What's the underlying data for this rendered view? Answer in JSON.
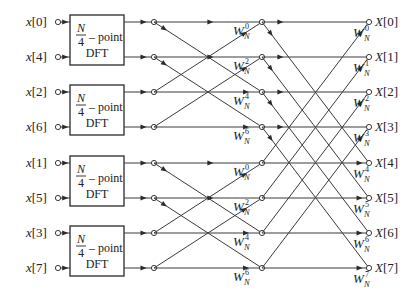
{
  "diagram": {
    "inputs": [
      "x[0]",
      "x[4]",
      "x[2]",
      "x[6]",
      "x[1]",
      "x[5]",
      "x[3]",
      "x[7]"
    ],
    "outputs": [
      "X[0]",
      "X[1]",
      "X[2]",
      "X[3]",
      "X[4]",
      "X[5]",
      "X[6]",
      "X[7]"
    ],
    "dft_blocks": [
      {
        "fraction_num": "N",
        "fraction_den": "4",
        "suffix": "– point",
        "label": "DFT"
      },
      {
        "fraction_num": "N",
        "fraction_den": "4",
        "suffix": "– point",
        "label": "DFT"
      },
      {
        "fraction_num": "N",
        "fraction_den": "4",
        "suffix": "– point",
        "label": "DFT"
      },
      {
        "fraction_num": "N",
        "fraction_den": "4",
        "suffix": "– point",
        "label": "DFT"
      }
    ],
    "stage2_twiddles": [
      {
        "base": "W",
        "sub": "N",
        "exp": "0"
      },
      {
        "base": "W",
        "sub": "N",
        "exp": "2"
      },
      {
        "base": "W",
        "sub": "N",
        "exp": "4"
      },
      {
        "base": "W",
        "sub": "N",
        "exp": "6"
      },
      {
        "base": "W",
        "sub": "N",
        "exp": "0"
      },
      {
        "base": "W",
        "sub": "N",
        "exp": "2"
      },
      {
        "base": "W",
        "sub": "N",
        "exp": "4"
      },
      {
        "base": "W",
        "sub": "N",
        "exp": "6"
      }
    ],
    "stage3_twiddles": [
      {
        "base": "W",
        "sub": "N",
        "exp": "0"
      },
      {
        "base": "W",
        "sub": "N",
        "exp": "1"
      },
      {
        "base": "W",
        "sub": "N",
        "exp": "2"
      },
      {
        "base": "W",
        "sub": "N",
        "exp": "3"
      },
      {
        "base": "W",
        "sub": "N",
        "exp": "4"
      },
      {
        "base": "W",
        "sub": "N",
        "exp": "5"
      },
      {
        "base": "W",
        "sub": "N",
        "exp": "6"
      },
      {
        "base": "W",
        "sub": "N",
        "exp": "7"
      }
    ]
  }
}
